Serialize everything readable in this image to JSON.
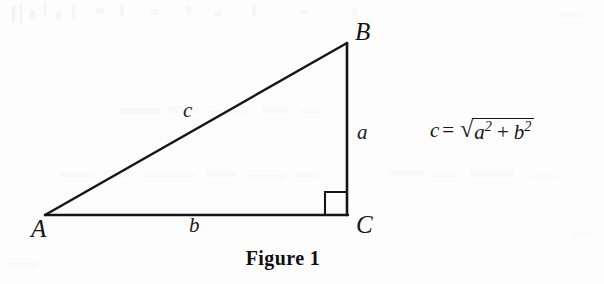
{
  "figure": {
    "caption": "Figure 1",
    "background_color": "#fdfdfd",
    "stroke_color": "#151515"
  },
  "triangle": {
    "type": "right-triangle",
    "vertices": [
      {
        "name": "A",
        "label": "A",
        "x": 45,
        "y": 215,
        "angle_type": "acute"
      },
      {
        "name": "B",
        "label": "B",
        "x": 347,
        "y": 43,
        "angle_type": "acute"
      },
      {
        "name": "C",
        "label": "C",
        "x": 347,
        "y": 215,
        "angle_type": "right"
      }
    ],
    "sides": [
      {
        "name": "hypotenuse",
        "label": "c",
        "from": "A",
        "to": "B"
      },
      {
        "name": "vertical-leg",
        "label": "a",
        "from": "B",
        "to": "C"
      },
      {
        "name": "base-leg",
        "label": "b",
        "from": "A",
        "to": "C"
      }
    ],
    "right_angle_marker": {
      "at_vertex": "C",
      "size": 22,
      "visible": true
    }
  },
  "formula": {
    "lhs": "c",
    "equals": "=",
    "radical_sign": "√",
    "term1_base": "a",
    "term1_exponent": "2",
    "plus": "+",
    "term2_base": "b",
    "term2_exponent": "2",
    "plain_text": "c = √(a² + b²)"
  }
}
